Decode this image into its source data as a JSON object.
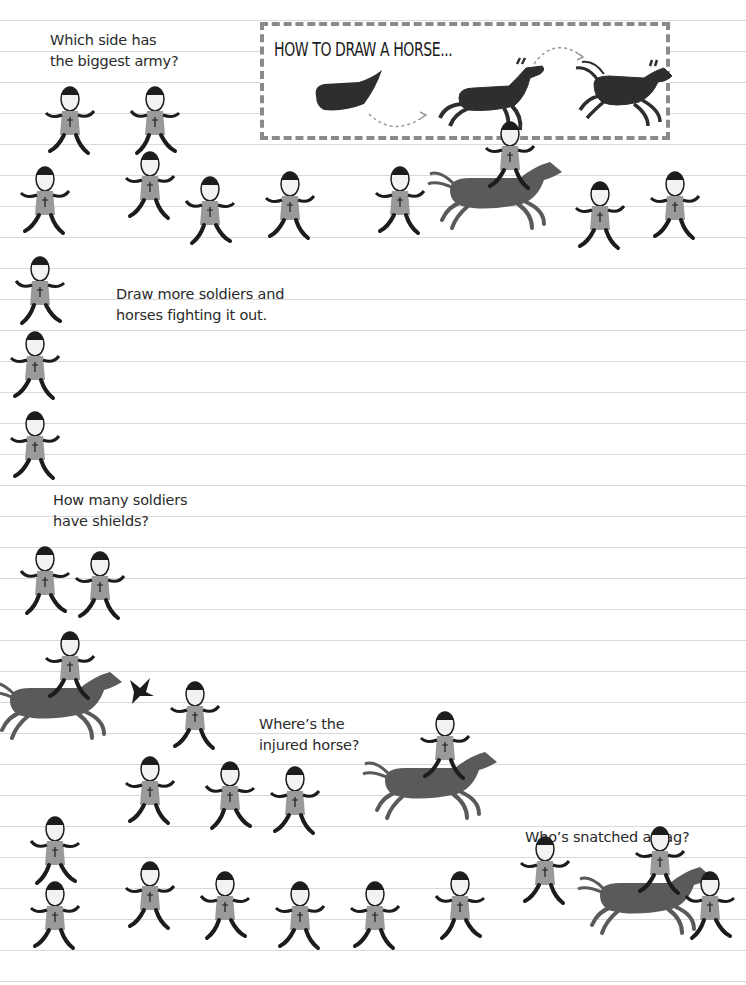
{
  "prompts": {
    "biggest_army": "Which side has\nthe biggest army?",
    "draw_more": "Draw more soldiers and\nhorses fighting it out.",
    "shields": "How many soldiers\nhave shields?",
    "injured_horse": "Where’s the\ninjured horse?",
    "snatched_flag": "Who’s snatched a flag?"
  },
  "how_to_box": {
    "title": "HOW TO DRAW A HORSE...",
    "steps": [
      "body-shape",
      "horse-outline",
      "finished-horse"
    ]
  },
  "colors": {
    "ink": "#1c1c1c",
    "tunic": "#9a9a9a",
    "horse": "#5a5a5a",
    "rule": "#d9d9d9",
    "dashed_border": "#8a8a8a"
  },
  "figures": [
    {
      "id": "soldier-running-1",
      "x": 40,
      "y": 85
    },
    {
      "id": "soldier-flag-bearer",
      "x": 125,
      "y": 85
    },
    {
      "id": "soldier-falling",
      "x": 15,
      "y": 165
    },
    {
      "id": "soldier-sword",
      "x": 120,
      "y": 150
    },
    {
      "id": "soldier-archer-1",
      "x": 180,
      "y": 175
    },
    {
      "id": "soldier-axe",
      "x": 260,
      "y": 170
    },
    {
      "id": "soldier-hit",
      "x": 370,
      "y": 165
    },
    {
      "id": "horse-rider-1",
      "x": 440,
      "y": 150
    },
    {
      "id": "soldier-running-2",
      "x": 570,
      "y": 180
    },
    {
      "id": "soldier-archer-2",
      "x": 645,
      "y": 170
    },
    {
      "id": "soldier-cross",
      "x": 10,
      "y": 255
    },
    {
      "id": "soldier-arrow-hit",
      "x": 5,
      "y": 330
    },
    {
      "id": "soldier-kneeling",
      "x": 5,
      "y": 410
    },
    {
      "id": "soldier-spear",
      "x": 15,
      "y": 545
    },
    {
      "id": "soldier-shield",
      "x": 70,
      "y": 550
    },
    {
      "id": "horse-rider-2",
      "x": 0,
      "y": 660
    },
    {
      "id": "bird",
      "x": 120,
      "y": 670
    },
    {
      "id": "soldier-tumbling",
      "x": 165,
      "y": 680
    },
    {
      "id": "soldier-archer-3",
      "x": 120,
      "y": 755
    },
    {
      "id": "soldier-axe-2",
      "x": 200,
      "y": 760
    },
    {
      "id": "soldier-injured",
      "x": 265,
      "y": 765
    },
    {
      "id": "horse-rider-3",
      "x": 375,
      "y": 740
    },
    {
      "id": "soldier-crouching",
      "x": 25,
      "y": 815
    },
    {
      "id": "row-bottom-1",
      "x": 25,
      "y": 880
    },
    {
      "id": "row-bottom-2",
      "x": 120,
      "y": 860
    },
    {
      "id": "row-bottom-3",
      "x": 195,
      "y": 870
    },
    {
      "id": "row-bottom-4",
      "x": 270,
      "y": 880
    },
    {
      "id": "row-bottom-5",
      "x": 345,
      "y": 880
    },
    {
      "id": "row-bottom-6",
      "x": 430,
      "y": 870
    },
    {
      "id": "row-bottom-7",
      "x": 515,
      "y": 835
    },
    {
      "id": "horse-flag-snatcher",
      "x": 590,
      "y": 855
    },
    {
      "id": "row-bottom-8",
      "x": 680,
      "y": 870
    }
  ]
}
